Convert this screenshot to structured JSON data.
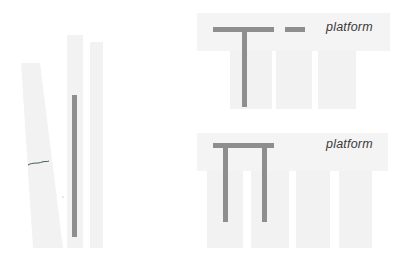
{
  "figure": {
    "left_panel": {
      "description": "three pale vertical strips, one slanted, with a dark vertical rod",
      "strips": 3,
      "rod_color": "#8e8e8e"
    },
    "top_right": {
      "shape": "T",
      "label": "platform",
      "has_dash": true
    },
    "bottom_right": {
      "shape": "Pi",
      "label": "platform"
    },
    "colors": {
      "background": "#ffffff",
      "strip": "#f2f2f2",
      "bar": "#8e8e8e",
      "text": "#3a3a3a"
    }
  }
}
